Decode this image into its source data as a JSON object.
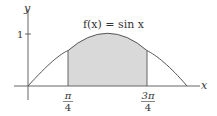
{
  "figure": {
    "function_label": "f(x) = sin x",
    "function_label_parts": {
      "f": "f",
      "x_paren": "(x)",
      "eq": " = sin ",
      "var": "x"
    },
    "x_axis_label": "x",
    "y_axis_label": "y",
    "y_tick_label": "1",
    "x_ticks": [
      {
        "numerator": "π",
        "denominator": "4"
      },
      {
        "numerator": "3π",
        "denominator": "4"
      }
    ],
    "shaded_region": {
      "from": "π/4",
      "to": "3π/4"
    },
    "colors": {
      "curve": "#555555",
      "shade": "#d9d9d9",
      "axis": "#555555"
    }
  }
}
